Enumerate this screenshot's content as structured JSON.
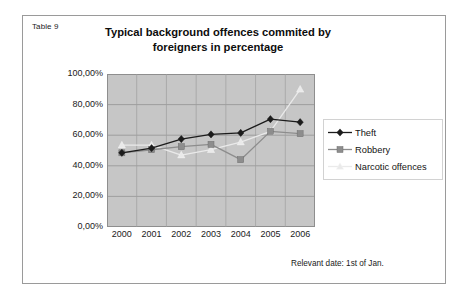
{
  "caption": "Table 9",
  "footnote": "Relevant date: 1st of Jan.",
  "title_line1": "Typical background offences commited by",
  "title_line2": "foreigners in percentage",
  "legend": {
    "items": [
      {
        "label": "Theft",
        "marker": "diamond-marker-icon",
        "color": "#1c1c1c"
      },
      {
        "label": "Robbery",
        "marker": "square-marker-icon",
        "color": "#8d8d8d"
      },
      {
        "label": "Narcotic offences",
        "marker": "triangle-marker-icon",
        "color": "#eaeaea"
      }
    ]
  },
  "chart_data": {
    "type": "line",
    "title": "Typical background offences commited by foreigners in percentage",
    "xlabel": "",
    "ylabel": "",
    "categories": [
      "2000",
      "2001",
      "2002",
      "2003",
      "2004",
      "2005",
      "2006"
    ],
    "ylim": [
      0,
      100
    ],
    "ytick_labels": [
      "100,00%",
      "80,00%",
      "60,00%",
      "40,00%",
      "20,00%",
      "0,00%"
    ],
    "ytick_values": [
      100,
      80,
      60,
      40,
      20,
      0
    ],
    "grid": true,
    "legend_position": "right",
    "unit": "percent",
    "series": [
      {
        "name": "Theft",
        "color": "#1c1c1c",
        "marker": "diamond",
        "values": [
          48.5,
          51.5,
          57.5,
          60.5,
          61.5,
          70.5,
          68.5
        ]
      },
      {
        "name": "Robbery",
        "color": "#8d8d8d",
        "marker": "square",
        "values": [
          48.5,
          50.5,
          52.5,
          54.0,
          44.0,
          62.5,
          61.0
        ]
      },
      {
        "name": "Narcotic offences",
        "color": "#eaeaea",
        "marker": "triangle",
        "values": [
          53.5,
          53.5,
          47.0,
          50.5,
          55.5,
          62.5,
          90.0
        ]
      }
    ]
  }
}
